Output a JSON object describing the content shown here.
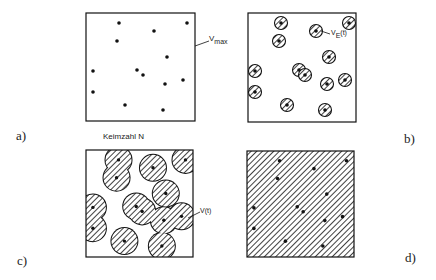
{
  "figure": {
    "panels": [
      {
        "id": "a",
        "label": "a)",
        "annotation": "V",
        "annotation_sub": "max",
        "caption": "Keimzahl N",
        "fill": "dots"
      },
      {
        "id": "b",
        "label": "b)",
        "annotation": "V",
        "annotation_sub": "E",
        "annotation_suffix": "(t)",
        "fill": "small-hatched-circles"
      },
      {
        "id": "c",
        "label": "c)",
        "annotation": "V(t)",
        "fill": "large-overlapping-hatched-circles"
      },
      {
        "id": "d",
        "label": "d)",
        "fill": "fully-hatched"
      }
    ],
    "nuclei_positions": [
      [
        33,
        10
      ],
      [
        101,
        10
      ],
      [
        68,
        18
      ],
      [
        31,
        28
      ],
      [
        81,
        44
      ],
      [
        7,
        58
      ],
      [
        51,
        57
      ],
      [
        57,
        62
      ],
      [
        97,
        67
      ],
      [
        79,
        71
      ],
      [
        7,
        79
      ],
      [
        39,
        92
      ],
      [
        77,
        97
      ]
    ],
    "colors": {
      "ink": "#111111",
      "background": "#ffffff"
    }
  }
}
